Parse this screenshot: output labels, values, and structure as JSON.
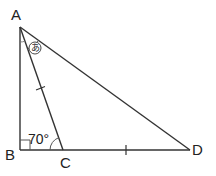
{
  "diagram": {
    "type": "geometry-triangle",
    "points": {
      "A": {
        "label": "A",
        "x": 20,
        "y": 27
      },
      "B": {
        "label": "B",
        "x": 20,
        "y": 150
      },
      "C": {
        "label": "C",
        "x": 63,
        "y": 150
      },
      "D": {
        "label": "D",
        "x": 190,
        "y": 150
      }
    },
    "segments": [
      "AB",
      "BC",
      "CD",
      "AC",
      "AD"
    ],
    "right_angle_at": "B",
    "angle_ACB": {
      "label": "70°",
      "value": 70
    },
    "angle_CAD": {
      "label": "あ",
      "marker": "circled"
    },
    "equal_marks": [
      "AC",
      "CD"
    ],
    "line_color": "#333333"
  }
}
